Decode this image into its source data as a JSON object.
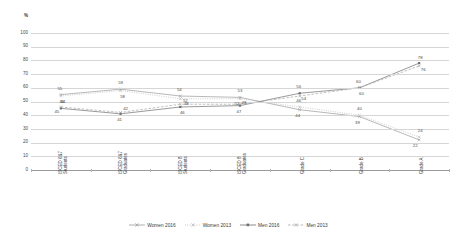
{
  "chart_data": {
    "type": "line",
    "title": "",
    "xlabel": "",
    "ylabel": "%",
    "ylim": [
      0,
      100
    ],
    "ytick_step": 10,
    "yticks": [
      "100",
      "90",
      "80",
      "70",
      "60",
      "50",
      "40",
      "30",
      "20",
      "10",
      "0"
    ],
    "grid": true,
    "legend_position": "bottom",
    "categories": [
      "ISCED 6&7 Students",
      "ISCED 6&7 Graduates",
      "ISCED 8 Students",
      "ISCED 8 Graduates",
      "Grade C",
      "Grade B",
      "Grade A"
    ],
    "category_lines": [
      [
        "ISCED 6&7",
        "Students"
      ],
      [
        "ISCED 6&7",
        "Graduates"
      ],
      [
        "ISCED 8",
        "Students"
      ],
      [
        "ISCED 8",
        "Graduates"
      ],
      [
        "Grade C"
      ],
      [
        "Grade B"
      ],
      [
        "Grade A"
      ]
    ],
    "series": [
      {
        "name": "Women 2016",
        "color": "#9a9a9a",
        "dash": "none",
        "marker": "x",
        "values": [
          55,
          59,
          54,
          53,
          44,
          39,
          22
        ],
        "label_offsets": [
          {
            "dx": -1,
            "dy": -6
          },
          {
            "dx": 0,
            "dy": -6
          },
          {
            "dx": -1,
            "dy": -6
          },
          {
            "dx": 0,
            "dy": -6
          },
          {
            "dx": -2,
            "dy": 6
          },
          {
            "dx": -2,
            "dy": 6
          },
          {
            "dx": -4,
            "dy": 6
          }
        ]
      },
      {
        "name": "Women 2013",
        "color": "#b5b5b5",
        "dash": "dotted",
        "marker": "x",
        "values": [
          54,
          58,
          52,
          52,
          46,
          40,
          24
        ],
        "label_offsets": [
          {
            "dx": 2,
            "dy": 6
          },
          {
            "dx": 2,
            "dy": 6
          },
          {
            "dx": 5,
            "dy": 2
          },
          {
            "dx": -3,
            "dy": 5
          },
          {
            "dx": -1,
            "dy": -6
          },
          {
            "dx": 0,
            "dy": -6
          },
          {
            "dx": 1,
            "dy": -6
          }
        ]
      },
      {
        "name": "Men 2016",
        "color": "#6e6e6e",
        "dash": "none",
        "marker": "square",
        "values": [
          45,
          41,
          46,
          47,
          56,
          60,
          78
        ],
        "label_offsets": [
          {
            "dx": -4,
            "dy": 4
          },
          {
            "dx": -1,
            "dy": 6
          },
          {
            "dx": 2,
            "dy": 6
          },
          {
            "dx": -1,
            "dy": 6
          },
          {
            "dx": -1,
            "dy": -6
          },
          {
            "dx": -1,
            "dy": -6
          },
          {
            "dx": 1,
            "dy": -5
          }
        ]
      },
      {
        "name": "Men 2013",
        "color": "#a8a8a8",
        "dash": "dashed",
        "marker": "x",
        "values": [
          46,
          42,
          48,
          48,
          54,
          60,
          76
        ],
        "label_offsets": [
          {
            "dx": 1,
            "dy": -5
          },
          {
            "dx": 5,
            "dy": -3
          },
          {
            "dx": 6,
            "dy": 0
          },
          {
            "dx": 4,
            "dy": -1
          },
          {
            "dx": 4,
            "dy": 3
          },
          {
            "dx": 2,
            "dy": 6
          },
          {
            "dx": 4,
            "dy": 4
          }
        ]
      }
    ]
  }
}
